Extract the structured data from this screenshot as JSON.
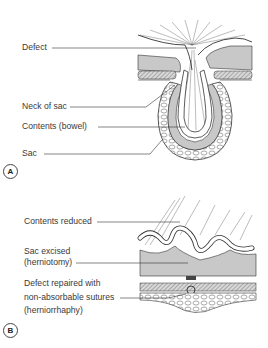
{
  "panels": [
    {
      "id": "A",
      "letter": "A",
      "labels": [
        {
          "key": "defect",
          "text": "Defect"
        },
        {
          "key": "neck_of_sac",
          "text": "Neck of sac"
        },
        {
          "key": "contents",
          "text": "Contents (bowel)"
        },
        {
          "key": "sac",
          "text": "Sac"
        }
      ]
    },
    {
      "id": "B",
      "letter": "B",
      "labels": [
        {
          "key": "contents_reduced",
          "text": "Contents reduced"
        },
        {
          "key": "sac_excised_1",
          "text": "Sac excised"
        },
        {
          "key": "sac_excised_2",
          "text": "(herniotomy)"
        },
        {
          "key": "defect_repaired_1",
          "text": "Defect repaired with"
        },
        {
          "key": "defect_repaired_2",
          "text": "non-absorbable sutures"
        },
        {
          "key": "defect_repaired_3",
          "text": "(herniorrhaphy)"
        }
      ]
    }
  ],
  "colors": {
    "line": "#333333",
    "grey_fill": "#c8c8c8",
    "hatch": "#8a8a8a",
    "background": "#ffffff"
  }
}
